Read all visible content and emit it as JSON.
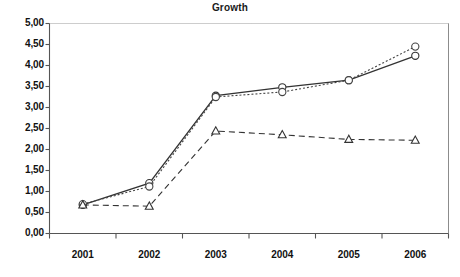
{
  "chart_data": {
    "type": "line",
    "title": "Growth",
    "xlabel": "",
    "ylabel": "",
    "categories": [
      "2001",
      "2002",
      "2003",
      "2004",
      "2005",
      "2006"
    ],
    "ylim": [
      0,
      5
    ],
    "ytick_labels": [
      "0,00",
      "0,50",
      "1,00",
      "1,50",
      "2,00",
      "2,50",
      "3,00",
      "3,50",
      "4,00",
      "4,50",
      "5,00"
    ],
    "ytick_values": [
      0,
      0.5,
      1,
      1.5,
      2,
      2.5,
      3,
      3.5,
      4,
      4.5,
      5
    ],
    "grid": false,
    "legend": "none",
    "decimal_separator": ",",
    "series": [
      {
        "name": "series-1",
        "marker": "circle",
        "line_style": "solid",
        "color": "#333333",
        "values": [
          0.68,
          1.2,
          3.28,
          3.48,
          3.65,
          4.23
        ]
      },
      {
        "name": "series-2",
        "marker": "circle",
        "line_style": "dotted",
        "color": "#444444",
        "values": [
          0.7,
          1.12,
          3.25,
          3.37,
          3.65,
          4.45
        ]
      },
      {
        "name": "series-3",
        "marker": "triangle",
        "line_style": "dashed",
        "color": "#333333",
        "values": [
          0.68,
          0.65,
          2.44,
          2.35,
          2.24,
          2.22
        ]
      }
    ]
  }
}
